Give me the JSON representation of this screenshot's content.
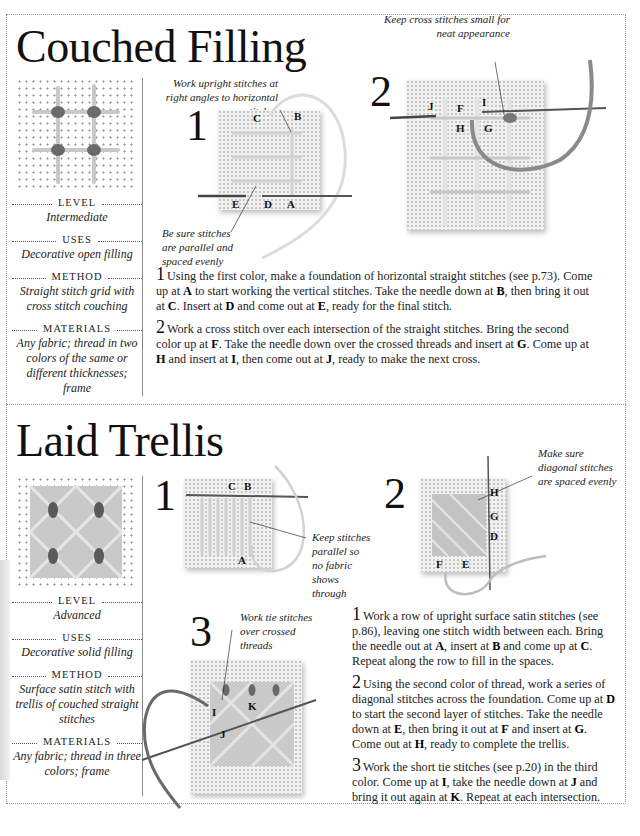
{
  "sections": [
    {
      "title": "Couched Filling",
      "meta": {
        "level": {
          "label": "Level",
          "value": "Intermediate"
        },
        "uses": {
          "label": "Uses",
          "value": "Decorative open filling"
        },
        "method": {
          "label": "Method",
          "value": "Straight stitch grid with cross stitch couching"
        },
        "materials": {
          "label": "Materials",
          "value": "Any fabric; thread in two colors of the same or different thicknesses; frame"
        }
      },
      "diagrams": [
        {
          "number": "1",
          "notes": [
            "Work upright stitches at right angles to horizontal stitches",
            "Be sure stitches are parallel and spaced evenly"
          ],
          "letters": [
            "C",
            "B",
            "E",
            "D",
            "A"
          ]
        },
        {
          "number": "2",
          "notes": [
            "Keep cross stitches small for neat appearance"
          ],
          "letters": [
            "J",
            "F",
            "I",
            "H",
            "G"
          ]
        }
      ],
      "steps": [
        {
          "number": "1",
          "parts": [
            "Using the first color, make a foundation of horizontal straight stitches (see p.73). Come up at ",
            "A",
            " to start working the vertical stitches. Take the needle down at ",
            "B",
            ", then bring it out at ",
            "C",
            ". Insert at ",
            "D",
            " and come out at ",
            "E",
            ", ready for the final stitch."
          ]
        },
        {
          "number": "2",
          "parts": [
            "Work a cross stitch over each intersection of the straight stitches. Bring the second color up at ",
            "F",
            ". Take the needle down over the crossed threads and insert at ",
            "G",
            ". Come up at ",
            "H",
            " and insert at ",
            "I",
            ", then come out at ",
            "J",
            ", ready to make the next cross."
          ]
        }
      ]
    },
    {
      "title": "Laid Trellis",
      "meta": {
        "level": {
          "label": "Level",
          "value": "Advanced"
        },
        "uses": {
          "label": "Uses",
          "value": "Decorative solid filling"
        },
        "method": {
          "label": "Method",
          "value": "Surface satin stitch with trellis of couched straight stitches"
        },
        "materials": {
          "label": "Materials",
          "value": "Any fabric; thread in three colors; frame"
        }
      },
      "diagrams": [
        {
          "number": "1",
          "notes": [
            "Keep stitches parallel so no fabric shows through"
          ],
          "letters": [
            "C",
            "B",
            "A"
          ]
        },
        {
          "number": "2",
          "notes": [
            "Make sure diagonal stitches are spaced evenly"
          ],
          "letters": [
            "H",
            "G",
            "D",
            "F",
            "E"
          ]
        },
        {
          "number": "3",
          "notes": [
            "Work tie stitches over crossed threads"
          ],
          "letters": [
            "I",
            "K",
            "J"
          ]
        }
      ],
      "steps": [
        {
          "number": "1",
          "parts": [
            "Work a row of upright surface satin stitches (see p.86), leaving one stitch width between each. Bring the needle out at ",
            "A",
            ", insert at ",
            "B",
            " and come up at ",
            "C",
            ". Repeat along the row to fill in the spaces."
          ]
        },
        {
          "number": "2",
          "parts": [
            "Using the second color of thread, work a series of diagonal stitches across the foundation. Come up at ",
            "D",
            " to start the second layer of stitches. Take the needle down at ",
            "E",
            ", then bring it out at ",
            "F",
            " and insert at ",
            "G",
            ". Come out at ",
            "H",
            ", ready to complete the trellis."
          ]
        },
        {
          "number": "3",
          "parts": [
            "Work the short tie stitches (see p.20) in the third color. Come up at ",
            "I",
            ", take the needle down at ",
            "J",
            " and bring it out again at ",
            "K",
            ". Repeat at each intersection."
          ]
        }
      ]
    }
  ],
  "colors": {
    "ink": "#1a1a1a",
    "rule": "#9a9a9a",
    "thread_light": "#cfcfcf",
    "thread_dark": "#555555"
  }
}
